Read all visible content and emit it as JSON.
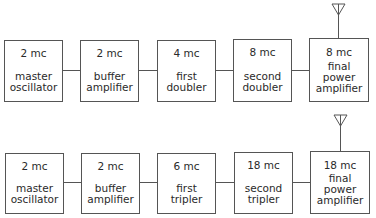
{
  "rows": [
    {
      "name": "doubler-chain",
      "stages": [
        {
          "freq": "2 mc",
          "label": [
            "master",
            "oscillator"
          ]
        },
        {
          "freq": "2 mc",
          "label": [
            "buffer",
            "amplifier"
          ]
        },
        {
          "freq": "4 mc",
          "label": [
            "first",
            "doubler"
          ]
        },
        {
          "freq": "8 mc",
          "label": [
            "second",
            "doubler"
          ]
        },
        {
          "freq": "8 mc",
          "label": [
            "final",
            "power",
            "amplifier"
          ]
        }
      ]
    },
    {
      "name": "tripler-chain",
      "stages": [
        {
          "freq": "2 mc",
          "label": [
            "master",
            "oscillator"
          ]
        },
        {
          "freq": "2 mc",
          "label": [
            "buffer",
            "amplifier"
          ]
        },
        {
          "freq": "6 mc",
          "label": [
            "first",
            "tripler"
          ]
        },
        {
          "freq": "18 mc",
          "label": [
            "second",
            "tripler"
          ]
        },
        {
          "freq": "18 mc",
          "label": [
            "final",
            "power",
            "amplifier"
          ]
        }
      ]
    }
  ],
  "icons": {
    "antenna": "antenna-icon"
  },
  "colors": {
    "line": "#555555",
    "text": "#2a2a2a",
    "background": "#ffffff"
  }
}
